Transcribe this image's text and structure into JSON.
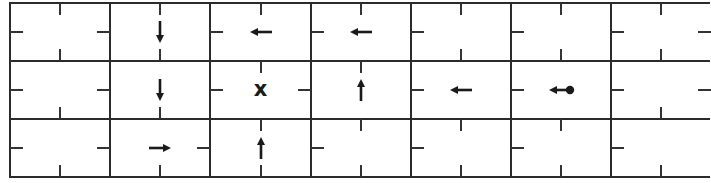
{
  "diagram": {
    "rows": 3,
    "cols": 7,
    "cell_width": 100.2,
    "cell_height": 58,
    "line_color": "#2b2b2b",
    "ink_color": "#1a1a1a",
    "cells": [
      {
        "r": 0,
        "c": 0,
        "ticks": [
          "top",
          "left",
          "right",
          "bottom"
        ],
        "symbol": null
      },
      {
        "r": 0,
        "c": 1,
        "ticks": [
          "top",
          "bottom"
        ],
        "symbol": "arrow-down"
      },
      {
        "r": 0,
        "c": 2,
        "ticks": [
          "top",
          "left"
        ],
        "symbol": "arrow-left"
      },
      {
        "r": 0,
        "c": 3,
        "ticks": [
          "top",
          "left"
        ],
        "symbol": "arrow-left"
      },
      {
        "r": 0,
        "c": 4,
        "ticks": [
          "top",
          "left",
          "bottom"
        ],
        "symbol": null
      },
      {
        "r": 0,
        "c": 5,
        "ticks": [
          "top",
          "left",
          "bottom"
        ],
        "symbol": null
      },
      {
        "r": 0,
        "c": 6,
        "ticks": [
          "top",
          "left",
          "right",
          "bottom"
        ],
        "symbol": null
      },
      {
        "r": 1,
        "c": 0,
        "ticks": [
          "left",
          "right",
          "bottom"
        ],
        "symbol": null
      },
      {
        "r": 1,
        "c": 1,
        "ticks": [
          "bottom"
        ],
        "symbol": "arrow-down"
      },
      {
        "r": 1,
        "c": 2,
        "ticks": [
          "top",
          "left",
          "right"
        ],
        "symbol": "goal-x"
      },
      {
        "r": 1,
        "c": 3,
        "ticks": [
          "top"
        ],
        "symbol": "arrow-up"
      },
      {
        "r": 1,
        "c": 4,
        "ticks": [
          "left"
        ],
        "symbol": "arrow-left"
      },
      {
        "r": 1,
        "c": 5,
        "ticks": [
          "left"
        ],
        "symbol": "start-arrow-left"
      },
      {
        "r": 1,
        "c": 6,
        "ticks": [
          "left",
          "right",
          "bottom"
        ],
        "symbol": null
      },
      {
        "r": 2,
        "c": 0,
        "ticks": [
          "left",
          "right",
          "bottom"
        ],
        "symbol": null
      },
      {
        "r": 2,
        "c": 1,
        "ticks": [
          "right",
          "bottom"
        ],
        "symbol": "arrow-right"
      },
      {
        "r": 2,
        "c": 2,
        "ticks": [
          "top",
          "bottom"
        ],
        "symbol": "arrow-up"
      },
      {
        "r": 2,
        "c": 3,
        "ticks": [
          "top",
          "left",
          "bottom"
        ],
        "symbol": null
      },
      {
        "r": 2,
        "c": 4,
        "ticks": [
          "top",
          "left",
          "bottom"
        ],
        "symbol": null
      },
      {
        "r": 2,
        "c": 5,
        "ticks": [
          "top",
          "left",
          "bottom"
        ],
        "symbol": null
      },
      {
        "r": 2,
        "c": 6,
        "ticks": [
          "left",
          "bottom"
        ],
        "symbol": null
      }
    ],
    "goal_label": "x"
  }
}
